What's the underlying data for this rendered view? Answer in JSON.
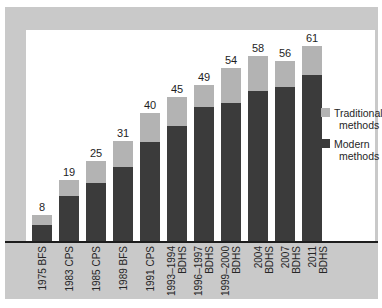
{
  "chart_data": {
    "type": "bar",
    "stacked": true,
    "title": "",
    "xlabel": "",
    "ylabel": "",
    "ylim": [
      0,
      66
    ],
    "grid": false,
    "legend_position": "right",
    "categories": [
      "1975 BFS",
      "1983 CPS",
      "1985 CPS",
      "1989 BFS",
      "1991 CPS",
      "1993–1994\nBDHS",
      "1996–1997\nBDHS",
      "1999–2000\nBDHS",
      "2004 BDHS",
      "2007 BDHS",
      "2011 BDHS"
    ],
    "series": [
      {
        "name": "Modern methods",
        "color": "#3b3b3b",
        "values": [
          5,
          14,
          18,
          23,
          31,
          36,
          42,
          43,
          47,
          48,
          52
        ]
      },
      {
        "name": "Traditional methods",
        "color": "#b3b3b3",
        "values": [
          3,
          5,
          7,
          8,
          9,
          9,
          7,
          11,
          11,
          8,
          9
        ]
      }
    ],
    "totals": [
      8,
      19,
      25,
      31,
      40,
      45,
      49,
      54,
      58,
      56,
      61
    ],
    "total_labels_shown": true
  },
  "legend": {
    "items": [
      {
        "label": "Traditional methods",
        "color": "#b3b3b3"
      },
      {
        "label": "Modern methods",
        "color": "#3b3b3b"
      }
    ]
  },
  "colors": {
    "panel_background": "#c9c9c9",
    "plot_background": "#ffffff",
    "axis_line": "#1d1d1d",
    "modern": "#3b3b3b",
    "traditional": "#b3b3b3",
    "text": "#262626"
  }
}
